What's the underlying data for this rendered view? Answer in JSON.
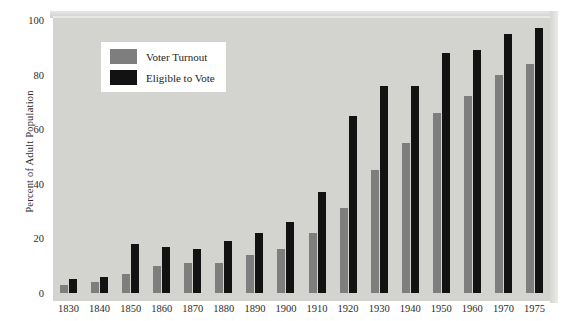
{
  "chart_data": {
    "type": "bar",
    "title": "",
    "xlabel": "",
    "ylabel": "Percent of Adult Population",
    "ylim": [
      0,
      100
    ],
    "yticks": [
      0,
      20,
      40,
      60,
      80,
      100
    ],
    "grid": false,
    "legend_position": "top-left-inside",
    "categories": [
      "1830",
      "1840",
      "1850",
      "1860",
      "1870",
      "1880",
      "1890",
      "1900",
      "1910",
      "1920",
      "1930",
      "1940",
      "1950",
      "1960",
      "1970",
      "1975"
    ],
    "series": [
      {
        "name": "Voter Turnout",
        "color": "#7e7e7e",
        "values": [
          3,
          4,
          7,
          10,
          11,
          11,
          14,
          16,
          22,
          31,
          45,
          55,
          66,
          72,
          80,
          84
        ]
      },
      {
        "name": "Eligible to Vote",
        "color": "#121212",
        "values": [
          5,
          6,
          18,
          17,
          16,
          19,
          22,
          26,
          37,
          65,
          76,
          76,
          88,
          89,
          95,
          97
        ]
      }
    ]
  },
  "legend": {
    "items": [
      {
        "label": "Voter Turnout",
        "swatch": "turnout"
      },
      {
        "label": "Eligible to Vote",
        "swatch": "eligible"
      }
    ]
  },
  "axis": {
    "y_title": "Percent of Adult Population"
  },
  "colors": {
    "plot_background": "#d3d3d0",
    "page_background": "#ffffff",
    "turnout": "#7e7e7e",
    "eligible": "#121212",
    "text": "#2b2b2b"
  }
}
